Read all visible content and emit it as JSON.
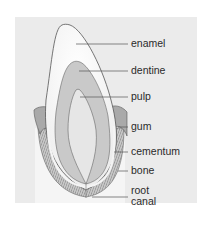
{
  "diagram": {
    "colors": {
      "background": "#ffffff",
      "panel": "#ebebeb",
      "tissue_band": "#f6f6f6",
      "enamel": "#f8f8f8",
      "dentine": "#c9c9c9",
      "pulp": "#e6e6e6",
      "gum": "#a9a9a9",
      "cementum": "#f2f2f2",
      "bone": "#b9b9b9",
      "outline": "#555555",
      "leader_line": "#555555",
      "label_text": "#2a2a2a"
    },
    "labels": [
      {
        "id": "enamel",
        "text": "enamel"
      },
      {
        "id": "dentine",
        "text": "dentine"
      },
      {
        "id": "pulp",
        "text": "pulp"
      },
      {
        "id": "gum",
        "text": "gum"
      },
      {
        "id": "cementum",
        "text": "cementum"
      },
      {
        "id": "bone",
        "text": "bone"
      },
      {
        "id": "root_canal_line1",
        "text": "root"
      },
      {
        "id": "root_canal_line2",
        "text": "canal"
      }
    ]
  }
}
